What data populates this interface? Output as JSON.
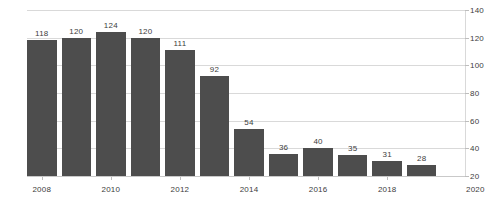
{
  "chart_data": {
    "type": "bar",
    "title": "",
    "subtitle": "",
    "xlabel": "",
    "ylabel": "",
    "categories": [
      "2008",
      "2009",
      "2010",
      "2011",
      "2012",
      "2013",
      "2014",
      "2015",
      "2016",
      "2017",
      "2018",
      "2019"
    ],
    "values": [
      118,
      120,
      124,
      120,
      111,
      92,
      54,
      36,
      40,
      35,
      31,
      28
    ],
    "data_labels": [
      "118",
      "120",
      "124",
      "120",
      "111",
      "92",
      "54",
      "36",
      "40",
      "35",
      "31",
      "28"
    ],
    "ylim": [
      20,
      140
    ],
    "ytick_labels": [
      "20",
      "40",
      "60",
      "80",
      "100",
      "120",
      "140"
    ],
    "ytick_values": [
      20,
      40,
      60,
      80,
      100,
      120,
      140
    ],
    "xtick_labels": [
      "2008",
      "2010",
      "2012",
      "2014",
      "2016",
      "2018"
    ],
    "xtick_categories": [
      "2008",
      "2010",
      "2012",
      "2014",
      "2016",
      "2018"
    ],
    "x_axis_end_label": "2020",
    "grid": true,
    "grid_axis": "y",
    "legend": false,
    "legend_position": "none",
    "y_axis_side": "right",
    "colors": {
      "bar": "#4d4d4d",
      "grid": "#d9d9d9",
      "axis": "#c9c9c9",
      "text": "#3d3d3d",
      "background": "#ffffff"
    }
  }
}
